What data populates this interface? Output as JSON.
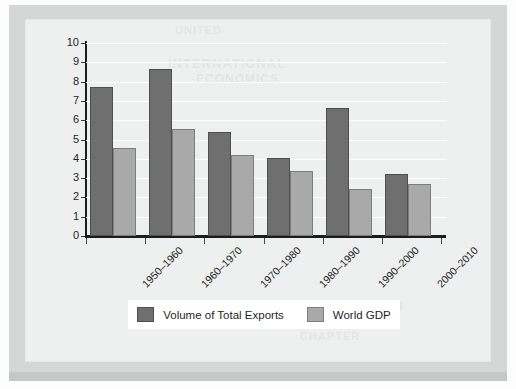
{
  "document": {
    "background_ghost_text": [
      "UNITED",
      "INTERNATIONAL",
      "ECONOMICS",
      "TRADE GROWTH",
      "CHAPTER"
    ]
  },
  "colors": {
    "series_exports": "#6f6f6f",
    "series_gdp": "#a9a9a9",
    "plot_background": "#eef0ef",
    "gridline": "#ffffff",
    "axis": "#1d1d1d",
    "page_border": "#d5d6d6",
    "legend_background": "#ffffff"
  },
  "chart_data": {
    "type": "bar",
    "title": "",
    "xlabel": "",
    "ylabel": "",
    "categories": [
      "1950–1960",
      "1960–1970",
      "1970–1980",
      "1980–1990",
      "1990–2000",
      "2000–2010"
    ],
    "series": [
      {
        "name": "Volume of Total Exports",
        "color": "#6f6f6f",
        "values": [
          7.7,
          8.65,
          5.4,
          4.05,
          6.65,
          3.2
        ]
      },
      {
        "name": "World GDP",
        "color": "#a9a9a9",
        "values": [
          4.55,
          5.55,
          4.2,
          3.35,
          2.45,
          2.7
        ]
      }
    ],
    "ylim": [
      0,
      10
    ],
    "ytick_values": [
      0,
      1,
      2,
      3,
      4,
      5,
      6,
      7,
      8,
      9,
      10
    ],
    "ytick_labels": [
      "0",
      "1",
      "2",
      "3",
      "4",
      "5",
      "6",
      "7",
      "8",
      "9",
      "10"
    ],
    "grid": true,
    "grid_axis": "y",
    "legend_position": "bottom",
    "xtick_label_rotation": -45
  },
  "legend": {
    "items": [
      {
        "label": "Volume of Total Exports",
        "series": "exports"
      },
      {
        "label": "World GDP",
        "series": "gdp"
      }
    ]
  }
}
